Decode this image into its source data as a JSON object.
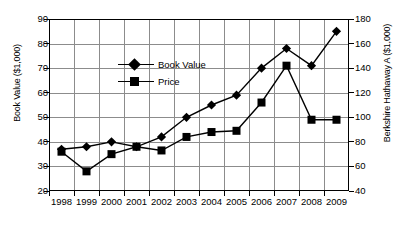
{
  "chart_data": {
    "type": "line",
    "title": "",
    "xlabel": "",
    "ylabel": "Book Value ($1,000)",
    "ylabel_right": "Berkshire Hathaway A ($1,000)",
    "categories": [
      "1998",
      "1999",
      "2000",
      "2001",
      "2002",
      "2003",
      "2004",
      "2005",
      "2006",
      "2007",
      "2008",
      "2009"
    ],
    "ylim": [
      20,
      90
    ],
    "yticks": [
      20,
      30,
      40,
      50,
      60,
      70,
      80,
      90
    ],
    "ylim_right": [
      40,
      180
    ],
    "yticks_right": [
      40,
      60,
      80,
      100,
      120,
      140,
      160,
      180
    ],
    "grid": true,
    "legend_position": "upper-left-inside",
    "series": [
      {
        "name": "Book Value",
        "marker": "diamond",
        "values": [
          37,
          38,
          40,
          38,
          42,
          50,
          55,
          59,
          70,
          78,
          71,
          85
        ]
      },
      {
        "name": "Price",
        "marker": "square",
        "values": [
          36,
          28,
          35,
          38,
          36.5,
          42,
          44,
          44.5,
          56,
          71,
          49,
          49
        ]
      }
    ]
  },
  "axes": {
    "left_title": "Book Value ($1,000)",
    "right_title": "Berkshire Hathaway A ($1,000)",
    "left_ticks": [
      "90",
      "80",
      "70",
      "60",
      "50",
      "40",
      "30",
      "20"
    ],
    "right_ticks": [
      "180",
      "160",
      "140",
      "120",
      "100",
      "80",
      "60",
      "40"
    ],
    "x_ticks": [
      "1998",
      "1999",
      "2000",
      "2001",
      "2002",
      "2003",
      "2004",
      "2005",
      "2006",
      "2007",
      "2008",
      "2009"
    ]
  },
  "legend": {
    "items": [
      {
        "label": "Book Value",
        "marker": "diamond"
      },
      {
        "label": "Price",
        "marker": "square"
      }
    ]
  },
  "colors": {
    "line": "#000000",
    "grid": "#8c8c8c",
    "frame": "#000000",
    "background": "#ffffff"
  }
}
